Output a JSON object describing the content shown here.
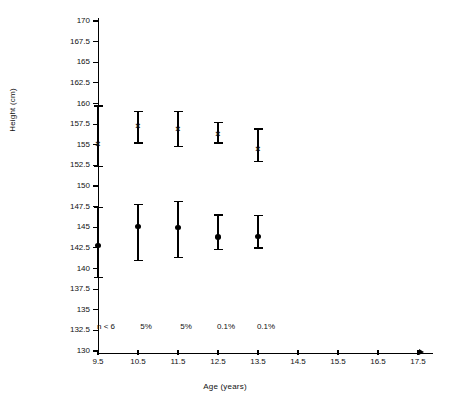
{
  "chart_data": {
    "type": "scatter",
    "title": "",
    "xlabel": "Age (years)",
    "ylabel": "Height (cm)",
    "xlim": [
      9.0,
      17.5
    ],
    "ylim": [
      130,
      170
    ],
    "ytick_step": 2.5,
    "grid": false,
    "legend": "none",
    "x": [
      9.5,
      10.5,
      11.5,
      12.5,
      13.5
    ],
    "xticks": [
      "9.5",
      "10.5",
      "11.5",
      "12.5",
      "13.5",
      "14.5",
      "15.5",
      "16.5",
      "17.5"
    ],
    "yticks": [
      "170",
      "167.5",
      "165",
      "162.5",
      "160",
      "157.5",
      "155",
      "152.5",
      "150",
      "147.5",
      "145",
      "142.5",
      "140",
      "137.5",
      "135",
      "132.5",
      "130"
    ],
    "annotations": [
      "n < 6",
      "5%",
      "5%",
      "0.1%",
      "0.1%"
    ],
    "series": [
      {
        "name": "upper-group",
        "marker": "x",
        "values": [
          155.0,
          157.2,
          156.8,
          156.2,
          154.4
        ],
        "lower": [
          152.4,
          155.2,
          154.8,
          155.2,
          153.0
        ],
        "upper": [
          159.7,
          159.0,
          159.0,
          157.7,
          156.9
        ]
      },
      {
        "name": "lower-group",
        "marker": "filled-circle",
        "values": [
          142.8,
          145.1,
          145.0,
          143.8,
          143.9
        ],
        "lower": [
          138.9,
          141.0,
          141.3,
          142.3,
          142.5
        ],
        "upper": [
          147.4,
          147.8,
          148.1,
          146.5,
          146.4
        ]
      }
    ]
  }
}
